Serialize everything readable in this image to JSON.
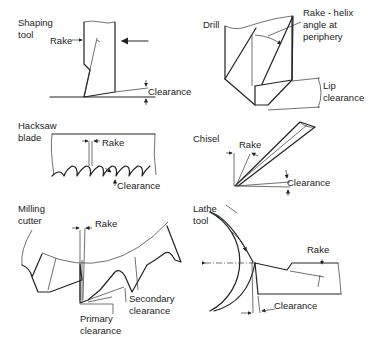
{
  "diagram": {
    "panels": [
      {
        "id": "shaping-tool",
        "name": "Shaping\ntool",
        "name_lines": [
          "Shaping",
          "tool"
        ],
        "labels": [
          "Rake",
          "Clearance"
        ]
      },
      {
        "id": "drill",
        "name_lines": [
          "Drill"
        ],
        "labels": [
          "Rake - helix",
          "angle at",
          "periphery",
          "Lip",
          "clearance"
        ]
      },
      {
        "id": "hacksaw-blade",
        "name_lines": [
          "Hacksaw",
          "blade"
        ],
        "labels": [
          "Rake",
          "Clearance"
        ]
      },
      {
        "id": "chisel",
        "name_lines": [
          "Chisel"
        ],
        "labels": [
          "Rake",
          "Clearance"
        ]
      },
      {
        "id": "milling-cutter",
        "name_lines": [
          "Milling",
          "cutter"
        ],
        "labels": [
          "Rake",
          "Secondary",
          "clearance",
          "Primary",
          "clearance"
        ]
      },
      {
        "id": "lathe-tool",
        "name_lines": [
          "Lathe",
          "tool"
        ],
        "labels": [
          "Rake",
          "Clearance"
        ]
      }
    ]
  },
  "text": {
    "shaping_1": "Shaping",
    "shaping_2": "tool",
    "shaping_rake": "Rake",
    "shaping_clearance": "Clearance",
    "drill": "Drill",
    "drill_rake_1": "Rake - helix",
    "drill_rake_2": "angle at",
    "drill_rake_3": "periphery",
    "drill_lip_1": "Lip",
    "drill_lip_2": "clearance",
    "hacksaw_1": "Hacksaw",
    "hacksaw_2": "blade",
    "hacksaw_rake": "Rake",
    "hacksaw_clearance": "Clearance",
    "chisel": "Chisel",
    "chisel_rake": "Rake",
    "chisel_clearance": "Clearance",
    "milling_1": "Milling",
    "milling_2": "cutter",
    "milling_rake": "Rake",
    "milling_secondary_1": "Secondary",
    "milling_secondary_2": "clearance",
    "milling_primary_1": "Primary",
    "milling_primary_2": "clearance",
    "lathe_1": "Lathe",
    "lathe_2": "tool",
    "lathe_rake": "Rake",
    "lathe_clearance": "Clearance"
  }
}
